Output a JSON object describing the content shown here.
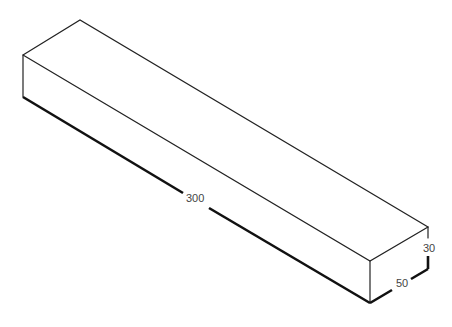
{
  "diagram": {
    "type": "isometric-box",
    "dimensions": {
      "length": "300",
      "width": "50",
      "height": "30"
    }
  }
}
